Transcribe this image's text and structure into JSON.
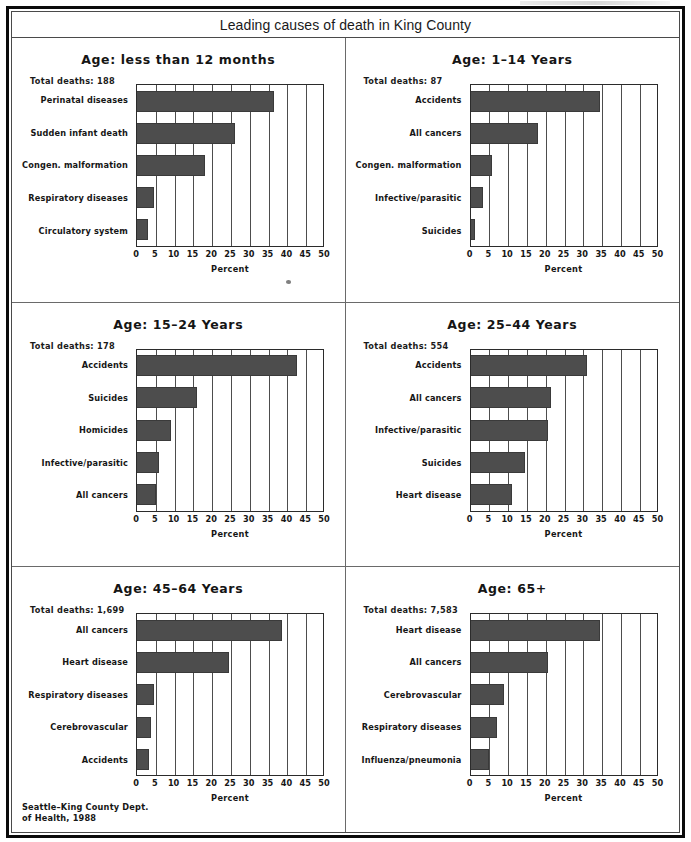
{
  "figure": {
    "title": "Leading causes of death in King County",
    "source_note": "Seattle–King County Dept.\nof Health, 1988"
  },
  "axis": {
    "xlabel": "Percent",
    "ticks": [
      0,
      5,
      10,
      15,
      20,
      25,
      30,
      35,
      40,
      45,
      50
    ],
    "xmin": 0,
    "xmax": 50
  },
  "chart_data": [
    {
      "type": "bar",
      "title": "Age: less than 12 months",
      "total_deaths_label": "Total deaths: 188",
      "total_deaths": 188,
      "orientation": "horizontal",
      "categories": [
        "Perinatal diseases",
        "Sudden infant death",
        "Congen. malformation",
        "Respiratory diseases",
        "Circulatory system"
      ],
      "values": [
        36.5,
        26.0,
        18.0,
        4.5,
        3.0
      ],
      "xlabel": "Percent",
      "ylabel": "",
      "xlim": [
        0,
        50
      ],
      "grid": true
    },
    {
      "type": "bar",
      "title": "Age: 1–14 Years",
      "total_deaths_label": "Total deaths: 87",
      "total_deaths": 87,
      "orientation": "horizontal",
      "categories": [
        "Accidents",
        "All cancers",
        "Congen. malformation",
        "Infective/parasitic",
        "Suicides"
      ],
      "values": [
        34.5,
        18.0,
        5.8,
        3.3,
        1.2
      ],
      "xlabel": "Percent",
      "ylabel": "",
      "xlim": [
        0,
        50
      ],
      "grid": true
    },
    {
      "type": "bar",
      "title": "Age: 15–24 Years",
      "total_deaths_label": "Total deaths: 178",
      "total_deaths": 178,
      "orientation": "horizontal",
      "categories": [
        "Accidents",
        "Suicides",
        "Homicides",
        "Infective/parasitic",
        "All cancers"
      ],
      "values": [
        42.5,
        16.0,
        9.0,
        5.8,
        5.0
      ],
      "xlabel": "Percent",
      "ylabel": "",
      "xlim": [
        0,
        50
      ],
      "grid": true
    },
    {
      "type": "bar",
      "title": "Age: 25–44 Years",
      "total_deaths_label": "Total deaths: 554",
      "total_deaths": 554,
      "orientation": "horizontal",
      "categories": [
        "Accidents",
        "All cancers",
        "Infective/parasitic",
        "Suicides",
        "Heart disease"
      ],
      "values": [
        31.0,
        21.5,
        20.5,
        14.5,
        11.0
      ],
      "xlabel": "Percent",
      "ylabel": "",
      "xlim": [
        0,
        50
      ],
      "grid": true
    },
    {
      "type": "bar",
      "title": "Age: 45–64 Years",
      "total_deaths_label": "Total deaths: 1,699",
      "total_deaths": 1699,
      "orientation": "horizontal",
      "categories": [
        "All cancers",
        "Heart disease",
        "Respiratory diseases",
        "Cerebrovascular",
        "Accidents"
      ],
      "values": [
        38.5,
        24.5,
        4.5,
        3.8,
        3.3
      ],
      "xlabel": "Percent",
      "ylabel": "",
      "xlim": [
        0,
        50
      ],
      "grid": true
    },
    {
      "type": "bar",
      "title": "Age: 65+",
      "total_deaths_label": "Total deaths: 7,583",
      "total_deaths": 7583,
      "orientation": "horizontal",
      "categories": [
        "Heart disease",
        "All cancers",
        "Cerebrovascular",
        "Respiratory diseases",
        "Influenza/pneumonia"
      ],
      "values": [
        34.5,
        20.5,
        9.0,
        7.0,
        5.0
      ],
      "xlabel": "Percent",
      "ylabel": "",
      "xlim": [
        0,
        50
      ],
      "grid": true
    }
  ],
  "colors": {
    "bar_fill": "#4d4d4d",
    "axis": "#2b2b2b",
    "frame": "#0a0a0a",
    "text": "#161616"
  }
}
